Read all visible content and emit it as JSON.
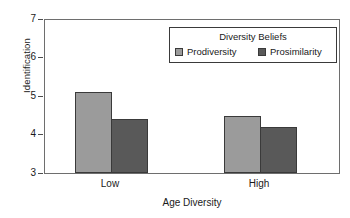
{
  "chart_data": {
    "type": "bar",
    "title": "",
    "xlabel": "Age Diversity",
    "ylabel": "Identification",
    "categories": [
      "Low",
      "High"
    ],
    "series": [
      {
        "name": "Prodiversity",
        "values": [
          5.08,
          4.46
        ],
        "color": "#9b9b9b"
      },
      {
        "name": "Prosimilarity",
        "values": [
          4.4,
          4.2
        ],
        "color": "#595959"
      }
    ],
    "ylim": [
      3,
      7
    ],
    "yticks": [
      3,
      4,
      5,
      6,
      7
    ],
    "ytick_labels": [
      "3",
      "4",
      "5",
      "6",
      "7"
    ],
    "grid": false,
    "legend": {
      "title": "Diversity Beliefs",
      "position": "top-right",
      "entries": [
        "Prodiversity",
        "Prosimilarity"
      ]
    }
  },
  "legend": {
    "title": "Diversity Beliefs",
    "items": [
      {
        "label": "Prodiversity",
        "color": "#9b9b9b"
      },
      {
        "label": "Prosimilarity",
        "color": "#595959"
      }
    ]
  },
  "axes": {
    "y_title": "Identification",
    "x_title": "Age Diversity",
    "y_ticks": [
      "7",
      "6",
      "5",
      "4",
      "3"
    ],
    "x_ticks": [
      "Low",
      "High"
    ]
  }
}
